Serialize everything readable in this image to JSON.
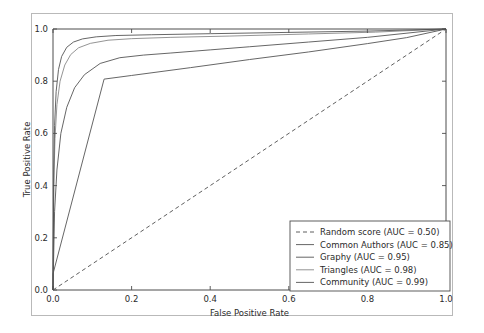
{
  "figure": {
    "background_color": "#ffffff",
    "frame_color": "#b9b9b9",
    "axis_color": "#4d4d4d",
    "text_color": "#2b2b2b"
  },
  "chart_data": {
    "type": "line",
    "title": "",
    "xlabel": "False Positive Rate",
    "ylabel": "True Positive Rate",
    "xlim": [
      0.0,
      1.0
    ],
    "ylim": [
      0.0,
      1.0
    ],
    "xticks": [
      "0.0",
      "0.2",
      "0.4",
      "0.6",
      "0.8",
      "1.0"
    ],
    "xtick_values": [
      0.0,
      0.2,
      0.4,
      0.6,
      0.8,
      1.0
    ],
    "yticks": [
      "0.0",
      "0.2",
      "0.4",
      "0.6",
      "0.8",
      "1.0"
    ],
    "ytick_values": [
      0.0,
      0.2,
      0.4,
      0.6,
      0.8,
      1.0
    ],
    "grid": false,
    "legend_position": "lower right",
    "series": [
      {
        "name": "Random score",
        "legend_label": "Random score (AUC = 0.50)",
        "auc": 0.5,
        "style": "dashed",
        "color": "#4d4d4d",
        "points": [
          [
            0.0,
            0.0
          ],
          [
            1.0,
            1.0
          ]
        ]
      },
      {
        "name": "Common Authors",
        "legend_label": "Common Authors (AUC = 0.85)",
        "auc": 0.85,
        "style": "solid",
        "color": "#555555",
        "points": [
          [
            0.0,
            0.0
          ],
          [
            0.0,
            0.062
          ],
          [
            0.13,
            0.808
          ],
          [
            0.2,
            0.822
          ],
          [
            0.35,
            0.852
          ],
          [
            0.5,
            0.883
          ],
          [
            0.65,
            0.912
          ],
          [
            0.8,
            0.944
          ],
          [
            0.9,
            0.967
          ],
          [
            1.0,
            1.0
          ]
        ]
      },
      {
        "name": "Graphy",
        "legend_label": "Graphy (AUC = 0.95)",
        "auc": 0.95,
        "style": "solid",
        "color": "#555555",
        "points": [
          [
            0.0,
            0.0
          ],
          [
            0.004,
            0.3
          ],
          [
            0.01,
            0.46
          ],
          [
            0.02,
            0.6
          ],
          [
            0.035,
            0.7
          ],
          [
            0.055,
            0.775
          ],
          [
            0.08,
            0.825
          ],
          [
            0.12,
            0.868
          ],
          [
            0.17,
            0.89
          ],
          [
            0.23,
            0.9
          ],
          [
            0.3,
            0.908
          ],
          [
            0.4,
            0.92
          ],
          [
            0.5,
            0.932
          ],
          [
            0.65,
            0.95
          ],
          [
            0.8,
            0.968
          ],
          [
            1.0,
            1.0
          ]
        ]
      },
      {
        "name": "Triangles",
        "legend_label": "Triangles (AUC = 0.98)",
        "auc": 0.98,
        "style": "solid",
        "color": "#888888",
        "points": [
          [
            0.0,
            0.0
          ],
          [
            0.002,
            0.4
          ],
          [
            0.005,
            0.58
          ],
          [
            0.01,
            0.71
          ],
          [
            0.018,
            0.8
          ],
          [
            0.03,
            0.862
          ],
          [
            0.045,
            0.902
          ],
          [
            0.065,
            0.928
          ],
          [
            0.095,
            0.945
          ],
          [
            0.14,
            0.957
          ],
          [
            0.2,
            0.963
          ],
          [
            0.3,
            0.968
          ],
          [
            0.45,
            0.973
          ],
          [
            0.65,
            0.981
          ],
          [
            0.82,
            0.988
          ],
          [
            1.0,
            1.0
          ]
        ]
      },
      {
        "name": "Community",
        "legend_label": "Community (AUC = 0.99)",
        "auc": 0.99,
        "style": "solid",
        "color": "#555555",
        "points": [
          [
            0.0,
            0.0
          ],
          [
            0.002,
            0.46
          ],
          [
            0.004,
            0.63
          ],
          [
            0.008,
            0.76
          ],
          [
            0.014,
            0.845
          ],
          [
            0.022,
            0.895
          ],
          [
            0.035,
            0.93
          ],
          [
            0.052,
            0.95
          ],
          [
            0.075,
            0.962
          ],
          [
            0.11,
            0.97
          ],
          [
            0.16,
            0.975
          ],
          [
            0.25,
            0.978
          ],
          [
            0.4,
            0.982
          ],
          [
            0.6,
            0.987
          ],
          [
            0.8,
            0.992
          ],
          [
            1.0,
            1.0
          ]
        ]
      }
    ]
  }
}
